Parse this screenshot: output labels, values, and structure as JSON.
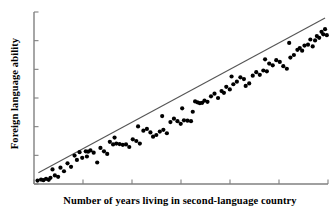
{
  "chart_data": {
    "type": "scatter",
    "title": "",
    "xlabel": "Number of years living in second-language country",
    "ylabel": "Foreign language ability",
    "xlim": [
      0,
      100
    ],
    "ylim": [
      0,
      100
    ],
    "grid": false,
    "legend": null,
    "axis_tick_labels": {
      "x": [],
      "y": []
    },
    "x_tick_count": 6,
    "y_tick_count": 6,
    "point_color": "#000000",
    "line_color": "#555555",
    "axis_color": "#808080",
    "background_color": "#ffffff",
    "marker_size": 2.1,
    "trendline": {
      "type": "linear",
      "x1": 1.5,
      "y1": 6.5,
      "x2": 99.0,
      "y2": 96.5
    },
    "points": [
      [
        1.2,
        2.0
      ],
      [
        2.4,
        2.6
      ],
      [
        3.2,
        2.2
      ],
      [
        4.1,
        3.0
      ],
      [
        5.0,
        2.4
      ],
      [
        5.6,
        3.6
      ],
      [
        6.3,
        8.5
      ],
      [
        7.1,
        5.0
      ],
      [
        8.2,
        4.2
      ],
      [
        9.0,
        9.5
      ],
      [
        10.2,
        7.4
      ],
      [
        11.4,
        12.0
      ],
      [
        12.6,
        10.0
      ],
      [
        13.8,
        16.5
      ],
      [
        14.6,
        14.0
      ],
      [
        15.5,
        18.5
      ],
      [
        16.4,
        15.2
      ],
      [
        17.6,
        19.0
      ],
      [
        18.4,
        18.8
      ],
      [
        19.2,
        19.5
      ],
      [
        20.3,
        18.2
      ],
      [
        21.5,
        12.5
      ],
      [
        22.6,
        21.0
      ],
      [
        23.8,
        19.0
      ],
      [
        24.9,
        17.5
      ],
      [
        25.8,
        24.5
      ],
      [
        26.9,
        23.0
      ],
      [
        28.0,
        23.5
      ],
      [
        29.1,
        23.2
      ],
      [
        30.2,
        22.8
      ],
      [
        31.3,
        23.0
      ],
      [
        32.4,
        21.5
      ],
      [
        33.6,
        26.0
      ],
      [
        34.8,
        25.0
      ],
      [
        36.0,
        23.5
      ],
      [
        37.2,
        31.0
      ],
      [
        38.4,
        32.0
      ],
      [
        39.6,
        30.0
      ],
      [
        40.5,
        27.5
      ],
      [
        41.6,
        28.5
      ],
      [
        42.8,
        30.5
      ],
      [
        44.0,
        31.5
      ],
      [
        45.2,
        29.5
      ],
      [
        46.4,
        36.0
      ],
      [
        47.6,
        38.0
      ],
      [
        48.8,
        36.5
      ],
      [
        49.9,
        35.0
      ],
      [
        51.0,
        37.0
      ],
      [
        52.2,
        36.8
      ],
      [
        53.4,
        36.5
      ],
      [
        54.0,
        42.0
      ],
      [
        54.8,
        48.0
      ],
      [
        55.6,
        47.5
      ],
      [
        56.4,
        47.0
      ],
      [
        57.2,
        47.2
      ],
      [
        58.0,
        48.5
      ],
      [
        59.0,
        47.8
      ],
      [
        60.2,
        51.0
      ],
      [
        61.4,
        52.5
      ],
      [
        62.6,
        50.0
      ],
      [
        63.8,
        54.0
      ],
      [
        64.6,
        53.0
      ],
      [
        65.4,
        56.5
      ],
      [
        66.6,
        55.0
      ],
      [
        67.8,
        58.0
      ],
      [
        69.0,
        59.5
      ],
      [
        70.2,
        62.0
      ],
      [
        71.4,
        61.0
      ],
      [
        72.0,
        57.0
      ],
      [
        73.2,
        58.5
      ],
      [
        74.4,
        63.0
      ],
      [
        75.6,
        65.0
      ],
      [
        76.8,
        63.5
      ],
      [
        78.0,
        66.0
      ],
      [
        79.2,
        65.5
      ],
      [
        80.0,
        70.0
      ],
      [
        81.2,
        69.0
      ],
      [
        82.4,
        72.0
      ],
      [
        83.6,
        71.0
      ],
      [
        84.8,
        68.5
      ],
      [
        86.0,
        67.0
      ],
      [
        87.2,
        73.5
      ],
      [
        88.4,
        75.0
      ],
      [
        89.6,
        78.0
      ],
      [
        90.4,
        79.0
      ],
      [
        91.2,
        77.5
      ],
      [
        92.0,
        80.5
      ],
      [
        93.2,
        81.0
      ],
      [
        94.0,
        84.0
      ],
      [
        94.8,
        80.0
      ],
      [
        95.6,
        83.5
      ],
      [
        96.2,
        86.0
      ],
      [
        97.0,
        85.0
      ],
      [
        97.8,
        88.5
      ],
      [
        98.4,
        87.0
      ],
      [
        99.0,
        90.0
      ],
      [
        99.6,
        86.5
      ],
      [
        86.8,
        82.0
      ],
      [
        78.6,
        72.5
      ],
      [
        67.2,
        62.5
      ],
      [
        50.4,
        44.0
      ],
      [
        43.6,
        39.5
      ],
      [
        35.4,
        33.5
      ],
      [
        27.4,
        27.0
      ],
      [
        18.0,
        16.0
      ]
    ]
  }
}
